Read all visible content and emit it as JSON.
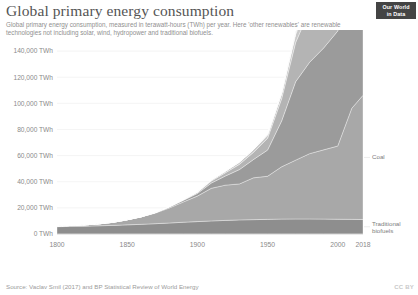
{
  "header": {
    "title": "Global primary energy consumption",
    "subtitle": "Global primary energy consumption, measured in terawatt-hours (TWh) per year. Here 'other renewables' are renewable technologies not including solar, wind, hydropower and traditional biofuels.",
    "logo_line1": "Our World",
    "logo_line2": "in Data"
  },
  "footer": {
    "source": "Source: Vaclav Smil (2017) and BP Statistical Review of World Energy",
    "license": "CC BY"
  },
  "colors": {
    "traditional_biofuels": "#8e8e8e",
    "coal": "#a8a8a8",
    "crude_oil": "#9b9b9b",
    "natural_gas": "#b4b4b4",
    "hydropower": "#c9c9c9",
    "nuclear": "#bcbcbc",
    "solar": "#d8d8d8",
    "wind": "#cfcfcf",
    "other_renewables": "#e2e2e2",
    "text": "#5b5b5b",
    "muted_text": "#8f8f8f",
    "gridline": "#ededed",
    "logo_bg": "#444444"
  },
  "chart_data": {
    "type": "area",
    "title": "Global primary energy consumption",
    "xlabel": "",
    "ylabel": "TWh",
    "xlim": [
      1800,
      2018
    ],
    "ylim": [
      0,
      150000
    ],
    "grid": true,
    "legend_position": "right-inline",
    "stacked": true,
    "ytick_labels": [
      "0 TWh",
      "20,000 TWh",
      "40,000 TWh",
      "60,000 TWh",
      "80,000 TWh",
      "100,000 TWh",
      "120,000 TWh",
      "140,000 TWh"
    ],
    "ytick_values": [
      0,
      20000,
      40000,
      60000,
      80000,
      100000,
      120000,
      140000
    ],
    "xtick_labels": [
      "1800",
      "1850",
      "1900",
      "1950",
      "2000",
      "2018"
    ],
    "xtick_values": [
      1800,
      1850,
      1900,
      1950,
      2000,
      2018
    ],
    "x": [
      1800,
      1810,
      1820,
      1830,
      1840,
      1850,
      1860,
      1870,
      1880,
      1890,
      1900,
      1910,
      1920,
      1930,
      1940,
      1950,
      1960,
      1970,
      1980,
      1990,
      2000,
      2010,
      2018
    ],
    "series": [
      {
        "name": "Traditional biofuels",
        "color": "#8e8e8e",
        "values": [
          5600,
          5800,
          6000,
          6300,
          6600,
          7000,
          7400,
          7900,
          8400,
          9000,
          9500,
          10000,
          10400,
          10800,
          11000,
          11200,
          11400,
          11500,
          11500,
          11400,
          11300,
          11200,
          11100
        ]
      },
      {
        "name": "Coal",
        "color": "#a8a8a8",
        "values": [
          500,
          700,
          1000,
          1500,
          2400,
          3900,
          5700,
          8100,
          11500,
          15500,
          19500,
          25000,
          27000,
          27500,
          32000,
          33000,
          40000,
          45000,
          50000,
          53000,
          56000,
          85000,
          95000
        ]
      },
      {
        "name": "Crude oil",
        "color": "#9b9b9b",
        "values": [
          0,
          0,
          0,
          0,
          0,
          0,
          100,
          300,
          700,
          1200,
          2000,
          4000,
          7000,
          11000,
          14000,
          20000,
          35000,
          60000,
          70000,
          78000,
          88000,
          97000,
          103000
        ]
      },
      {
        "name": "Natural gas",
        "color": "#b4b4b4",
        "values": [
          0,
          0,
          0,
          0,
          0,
          0,
          0,
          100,
          200,
          400,
          700,
          1500,
          2500,
          4000,
          5500,
          9000,
          17000,
          30000,
          40000,
          50000,
          60000,
          78000,
          90000
        ]
      },
      {
        "name": "Hydropower",
        "color": "#c9c9c9",
        "values": [
          0,
          0,
          0,
          0,
          0,
          0,
          0,
          0,
          100,
          200,
          400,
          800,
          1200,
          1800,
          2200,
          2800,
          4000,
          6000,
          8000,
          9500,
          11000,
          14000,
          16000
        ]
      },
      {
        "name": "Nuclear",
        "color": "#bcbcbc",
        "values": [
          0,
          0,
          0,
          0,
          0,
          0,
          0,
          0,
          0,
          0,
          0,
          0,
          0,
          0,
          0,
          0,
          200,
          1500,
          5000,
          8500,
          9500,
          9000,
          8000
        ]
      },
      {
        "name": "Solar",
        "color": "#d8d8d8",
        "values": [
          0,
          0,
          0,
          0,
          0,
          0,
          0,
          0,
          0,
          0,
          0,
          0,
          0,
          0,
          0,
          0,
          0,
          0,
          0,
          0,
          100,
          800,
          3000
        ]
      },
      {
        "name": "Wind",
        "color": "#cfcfcf",
        "values": [
          0,
          0,
          0,
          0,
          0,
          0,
          0,
          0,
          0,
          0,
          0,
          0,
          0,
          0,
          0,
          0,
          0,
          0,
          0,
          100,
          500,
          2500,
          6000
        ]
      },
      {
        "name": "Other renewables",
        "color": "#e2e2e2",
        "values": [
          0,
          0,
          0,
          0,
          0,
          0,
          0,
          0,
          0,
          0,
          0,
          0,
          0,
          0,
          0,
          100,
          300,
          700,
          1200,
          1800,
          2500,
          4000,
          6000
        ]
      }
    ],
    "legend_entries": [
      {
        "label": "Other renewables",
        "color": "#e2e2e2",
        "faint": false
      },
      {
        "label": "Wind",
        "color": "#cfcfcf",
        "faint": true
      },
      {
        "label": "Nuclear",
        "color": "#bcbcbc",
        "faint": false
      },
      {
        "label": "Hydropower",
        "color": "#c9c9c9",
        "faint": true
      },
      {
        "label": "Natural gas",
        "color": "#b4b4b4",
        "faint": false
      },
      {
        "label": "Crude oil",
        "color": "#9b9b9b",
        "faint": false
      },
      {
        "label": "Coal",
        "color": "#a8a8a8",
        "faint": false
      },
      {
        "label": "Traditional biofuels",
        "color": "#8e8e8e",
        "faint": false
      }
    ]
  }
}
